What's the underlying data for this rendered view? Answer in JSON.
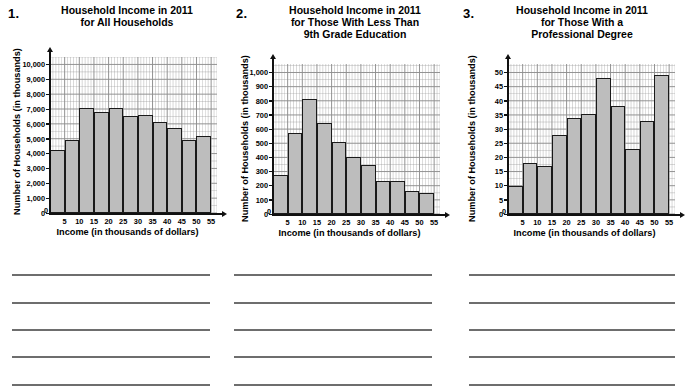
{
  "page": {
    "background": "#ffffff",
    "bar_fill": "#bdbdbd",
    "bar_stroke": "#1a1a1a",
    "grid_color": "#8a8a8a",
    "axis_color": "#111111"
  },
  "problems": [
    {
      "number": "1.",
      "title_lines": [
        "Household Income in 2011",
        "for All Households"
      ],
      "answer_lines": [
        "",
        "",
        "",
        "",
        ""
      ]
    },
    {
      "number": "2.",
      "title_lines": [
        "Household Income in 2011",
        "for Those With Less Than",
        "9th Grade Education"
      ],
      "answer_lines": [
        "",
        "",
        "",
        "",
        ""
      ]
    },
    {
      "number": "3.",
      "title_lines": [
        "Household Income in 2011",
        "for Those With a",
        "Professional Degree"
      ],
      "answer_lines": [
        "",
        "",
        "",
        "",
        ""
      ]
    }
  ],
  "chart_data": [
    {
      "type": "bar",
      "title": "Household Income in 2011 for All Households",
      "xlabel": "Income (in thousands of dollars)",
      "ylabel": "Number of Households (in thousands)",
      "categories": [
        "0-5",
        "5-10",
        "10-15",
        "15-20",
        "20-25",
        "25-30",
        "30-35",
        "35-40",
        "40-45",
        "45-50",
        "50-55"
      ],
      "bin_edges": [
        0,
        5,
        10,
        15,
        20,
        25,
        30,
        35,
        40,
        45,
        50,
        55
      ],
      "values": [
        4250,
        4900,
        7100,
        6800,
        7050,
        6500,
        6600,
        6100,
        5700,
        4900,
        5150
      ],
      "x": [
        0,
        5,
        10,
        15,
        20,
        25,
        30,
        35,
        40,
        45,
        50,
        55
      ],
      "xticklabels": [
        "5",
        "10",
        "15",
        "20",
        "25",
        "30",
        "35",
        "40",
        "45",
        "50",
        "55"
      ],
      "ylim": [
        0,
        10500
      ],
      "xlim": [
        0,
        57
      ],
      "yticks": [
        0,
        1000,
        2000,
        3000,
        4000,
        5000,
        6000,
        7000,
        8000,
        9000,
        10000
      ],
      "yticklabels": [
        "0",
        "1,000",
        "2,000",
        "3,000",
        "4,000",
        "5,000",
        "6,000",
        "7,000",
        "8,000",
        "9,000",
        "10,000"
      ],
      "grid": true,
      "minor_grid": true,
      "legend": "none"
    },
    {
      "type": "bar",
      "title": "Household Income in 2011 for Those With Less Than 9th Grade Education",
      "xlabel": "Income (in thousands of dollars)",
      "ylabel": "Number of Households (in thousands)",
      "categories": [
        "0-5",
        "5-10",
        "10-15",
        "15-20",
        "20-25",
        "25-30",
        "30-35",
        "35-40",
        "40-45",
        "45-50",
        "50-55"
      ],
      "bin_edges": [
        0,
        5,
        10,
        15,
        20,
        25,
        30,
        35,
        40,
        45,
        50,
        55
      ],
      "values": [
        275,
        575,
        810,
        640,
        510,
        405,
        345,
        235,
        232,
        162,
        150
      ],
      "x": [
        0,
        5,
        10,
        15,
        20,
        25,
        30,
        35,
        40,
        45,
        50,
        55
      ],
      "xticklabels": [
        "5",
        "10",
        "15",
        "20",
        "25",
        "30",
        "35",
        "40",
        "45",
        "50",
        "55"
      ],
      "ylim": [
        0,
        1060
      ],
      "xlim": [
        0,
        57
      ],
      "yticks": [
        0,
        100,
        200,
        300,
        400,
        500,
        600,
        700,
        800,
        900,
        1000
      ],
      "yticklabels": [
        "0",
        "100",
        "200",
        "300",
        "400",
        "500",
        "600",
        "700",
        "800",
        "900",
        "1,000"
      ],
      "grid": true,
      "minor_grid": true,
      "legend": "none"
    },
    {
      "type": "bar",
      "title": "Household Income in 2011 for Those With a Professional Degree",
      "xlabel": "Income (in thousands of dollars)",
      "ylabel": "Number of Households (in thousands)",
      "categories": [
        "0-5",
        "5-10",
        "10-15",
        "15-20",
        "20-25",
        "25-30",
        "30-35",
        "35-40",
        "40-45",
        "45-50",
        "50-55"
      ],
      "bin_edges": [
        0,
        5,
        10,
        15,
        20,
        25,
        30,
        35,
        40,
        45,
        50,
        55
      ],
      "values": [
        10,
        18,
        17,
        28,
        34,
        35.5,
        48,
        38,
        23,
        33,
        49
      ],
      "x": [
        0,
        5,
        10,
        15,
        20,
        25,
        30,
        35,
        40,
        45,
        50,
        55
      ],
      "xticklabels": [
        "5",
        "10",
        "15",
        "20",
        "25",
        "30",
        "35",
        "40",
        "45",
        "50",
        "55"
      ],
      "ylim": [
        0,
        53
      ],
      "xlim": [
        0,
        57
      ],
      "yticks": [
        0,
        5,
        10,
        15,
        20,
        25,
        30,
        35,
        40,
        45,
        50
      ],
      "yticklabels": [
        "0",
        "5",
        "10",
        "15",
        "20",
        "25",
        "30",
        "35",
        "40",
        "45",
        "50"
      ],
      "grid": true,
      "minor_grid": true,
      "legend": "none"
    }
  ]
}
